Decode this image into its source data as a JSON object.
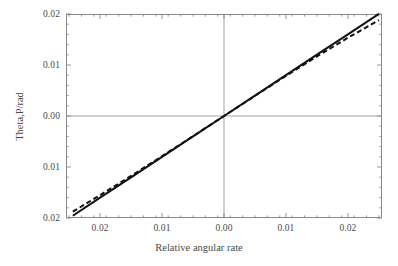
{
  "chart_data": {
    "type": "line",
    "title": "",
    "xlabel": "Relative angular rate",
    "ylabel": "Theta,P/rad",
    "xlim": [
      -0.0255,
      0.0255
    ],
    "ylim": [
      -0.02,
      0.02
    ],
    "grid": false,
    "zero_lines": true,
    "legend": "none",
    "x_ticks": [
      {
        "value": -0.02,
        "label": "0.02"
      },
      {
        "value": -0.01,
        "label": "0.01"
      },
      {
        "value": 0.0,
        "label": "0.00"
      },
      {
        "value": 0.01,
        "label": "0.01"
      },
      {
        "value": 0.02,
        "label": "0.02"
      }
    ],
    "y_ticks": [
      {
        "value": 0.02,
        "label": "0.02"
      },
      {
        "value": 0.01,
        "label": "0.01"
      },
      {
        "value": 0.0,
        "label": "0.00"
      },
      {
        "value": -0.01,
        "label": "0.01"
      },
      {
        "value": -0.02,
        "label": "0.02"
      }
    ],
    "minor_ticks_per_major": 5,
    "series": [
      {
        "name": "solid-line",
        "style": "solid",
        "color": "#111111",
        "width": 2.0,
        "x": [
          -0.0244,
          -0.02,
          -0.015,
          -0.01,
          -0.005,
          0.0,
          0.005,
          0.01,
          0.015,
          0.02,
          0.025
        ],
        "y": [
          -0.01955,
          -0.01602,
          -0.01202,
          -0.00801,
          -0.00401,
          0.0,
          0.00401,
          0.00801,
          0.01202,
          0.01602,
          0.02003
        ]
      },
      {
        "name": "dashed-line",
        "style": "dashed",
        "color": "#111111",
        "width": 2.0,
        "dash_pattern": "5,3",
        "x": [
          -0.0244,
          -0.02,
          -0.015,
          -0.01,
          -0.005,
          0.0,
          0.005,
          0.01,
          0.015,
          0.02,
          0.025
        ],
        "y": [
          -0.01875,
          -0.01552,
          -0.01175,
          -0.00788,
          -0.00396,
          0.0,
          0.00396,
          0.00788,
          0.01168,
          0.01535,
          0.0188
        ]
      }
    ]
  },
  "axes": {
    "x_title": "Relative angular rate",
    "y_title": "Theta,P/rad"
  },
  "style": {
    "background": "#ffffff",
    "frame_color": "#8a8a8a",
    "zero_line_color": "#999999",
    "text_color": "#4a4a4a",
    "line_color": "#111111"
  }
}
